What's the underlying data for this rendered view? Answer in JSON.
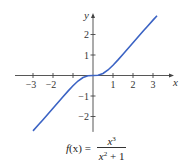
{
  "chart_data": {
    "type": "line",
    "function": "x^3/(x^2+1)",
    "xlabel": "x",
    "ylabel": "y",
    "xlim": [
      -3.9,
      3.95
    ],
    "ylim": [
      -2.75,
      2.95
    ],
    "grid": false,
    "legend": null,
    "x_ticks": [
      -3,
      -2,
      -1,
      1,
      2,
      3
    ],
    "x_tick_labels": [
      "−3",
      "−2",
      "",
      "1",
      "2",
      "3"
    ],
    "y_ticks": [
      -2,
      -1,
      1,
      2
    ],
    "y_tick_labels": [
      "−2",
      "−1",
      "1",
      "2"
    ],
    "series": [
      {
        "name": "f(x)",
        "color": "#3b63c4",
        "x": [
          -3.0,
          -2.75,
          -2.5,
          -2.25,
          -2.0,
          -1.75,
          -1.5,
          -1.25,
          -1.0,
          -0.75,
          -0.5,
          -0.25,
          0.0,
          0.25,
          0.5,
          0.75,
          1.0,
          1.25,
          1.5,
          1.75,
          2.0,
          2.25,
          2.5,
          2.75,
          3.0,
          3.2
        ],
        "y": [
          -2.7,
          -2.429,
          -2.155,
          -1.879,
          -1.6,
          -1.319,
          -1.038,
          -0.762,
          -0.5,
          -0.27,
          -0.1,
          -0.015,
          0.0,
          0.015,
          0.1,
          0.27,
          0.5,
          0.762,
          1.038,
          1.319,
          1.6,
          1.879,
          2.155,
          2.429,
          2.7,
          2.915
        ]
      }
    ]
  },
  "formula": {
    "lhs_f": "f",
    "lhs_x": "(x) =",
    "num_base": "x",
    "num_exp": "3",
    "den_base": "x",
    "den_exp": "2",
    "den_rest": " + 1"
  },
  "colors": {
    "curve": "#3b63c4",
    "axis": "#444444"
  }
}
